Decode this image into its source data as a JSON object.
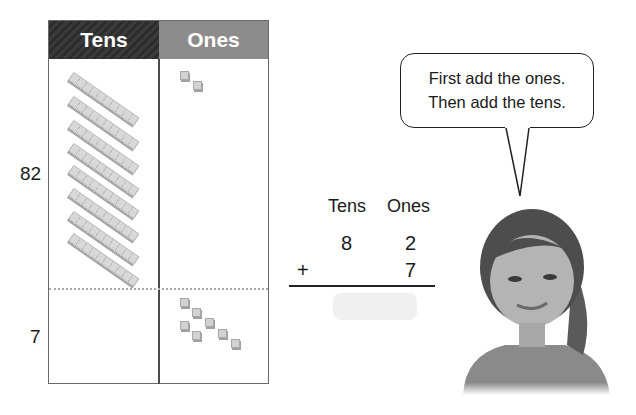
{
  "mat": {
    "headers": {
      "tens": "Tens",
      "ones": "Ones"
    },
    "colors": {
      "tens_header": "#2f2f2f",
      "ones_header": "#8c8c8c"
    },
    "rows": [
      {
        "label": "82",
        "tens_rods": 8,
        "ones_cubes": 2
      },
      {
        "label": "7",
        "tens_rods": 0,
        "ones_cubes": 7
      }
    ]
  },
  "addition": {
    "column_headers": {
      "tens": "Tens",
      "ones": "Ones"
    },
    "top": {
      "tens": "8",
      "ones": "2"
    },
    "bottom": {
      "operator": "+",
      "tens": "",
      "ones": "7"
    },
    "answer": ""
  },
  "speech_bubble": {
    "line1": "First add the ones.",
    "line2": "Then add the tens."
  },
  "character": {
    "description": "smiling girl"
  }
}
